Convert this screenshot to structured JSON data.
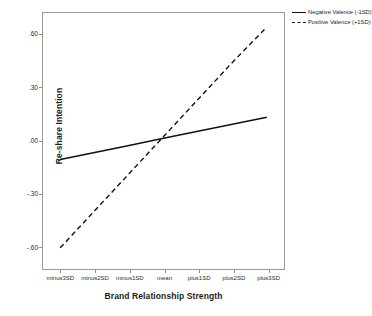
{
  "chart_data": {
    "type": "line",
    "title": "",
    "xlabel": "Brand Relationship Strength",
    "ylabel": "Re-share Intention",
    "categories": [
      "minus3SD",
      "minus2SD",
      "minus1SD",
      "mean",
      "plus1SD",
      "plus2SD",
      "plus3SD"
    ],
    "x": [
      -3,
      -2,
      -1,
      0,
      1,
      2,
      3
    ],
    "ytick_labels": [
      ".60",
      ".30",
      ".00",
      "-.30",
      "-.60"
    ],
    "ytick_values": [
      0.6,
      0.3,
      0.0,
      -0.3,
      -0.6
    ],
    "ylim": [
      -0.73,
      0.72
    ],
    "grid": false,
    "legend_position": "top-right",
    "series": [
      {
        "name": "Negative Valence (-1SD)",
        "style": "solid",
        "color": "#111111",
        "values": [
          -0.11,
          -0.07,
          -0.03,
          0.01,
          0.05,
          0.09,
          0.13
        ]
      },
      {
        "name": "Positive Valence (+1SD)",
        "style": "dashed",
        "color": "#111111",
        "values": [
          -0.61,
          -0.4,
          -0.19,
          0.02,
          0.23,
          0.44,
          0.64
        ]
      }
    ]
  }
}
